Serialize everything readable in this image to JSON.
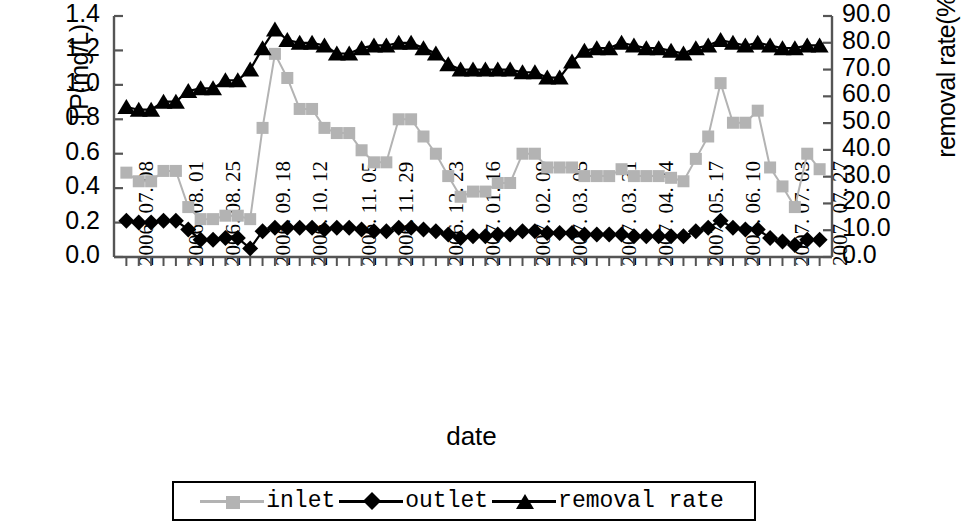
{
  "axes": {
    "y_left_title": "TP(mg/L)",
    "y_right_title": "removal rate(%)",
    "x_title": "date",
    "y_left_ticks": [
      "1.4",
      "1.2",
      "1.0",
      "0.8",
      "0.6",
      "0.4",
      "0.2",
      "0.0"
    ],
    "y_right_ticks": [
      "90.0",
      "80.0",
      "70.0",
      "60.0",
      "50.0",
      "40.0",
      "30.0",
      "20.0",
      "10.0",
      "0.0"
    ],
    "x_ticks": [
      "2006. 07. 08",
      "2006. 08. 01",
      "2006. 08. 25",
      "2006. 09. 18",
      "2006. 10. 12",
      "2006. 11. 05",
      "2006. 11. 29",
      "2006. 12. 23",
      "2007. 01. 16",
      "2007. 02. 09",
      "2007. 03. 05",
      "2007. 03. 31",
      "2007. 04. 24",
      "2007. 05. 17",
      "2007. 06. 10",
      "2007. 07. 03",
      "2007. 07. 27"
    ]
  },
  "legend": {
    "items": [
      {
        "label": "inlet",
        "marker": "square",
        "color": "#b0b0b0"
      },
      {
        "label": "outlet",
        "marker": "diamond",
        "color": "#000000"
      },
      {
        "label": "removal rate",
        "marker": "triangle",
        "color": "#000000"
      }
    ]
  },
  "colors": {
    "inlet": "#b3b3b3",
    "outlet": "#000000",
    "removal_rate": "#000000",
    "axis": "#555555"
  },
  "chart_data": {
    "type": "line",
    "title": "",
    "xlabel": "date",
    "ylabel": "TP(mg/L)",
    "y2label": "removal rate(%)",
    "ylim": [
      0,
      1.4
    ],
    "y2lim": [
      0,
      90
    ],
    "grid": false,
    "legend_position": "bottom",
    "x_tick_labels": [
      "2006. 07. 08",
      "2006. 08. 01",
      "2006. 08. 25",
      "2006. 09. 18",
      "2006. 10. 12",
      "2006. 11. 05",
      "2006. 11. 29",
      "2006. 12. 23",
      "2007. 01. 16",
      "2007. 02. 09",
      "2007. 03. 05",
      "2007. 03. 31",
      "2007. 04. 24",
      "2007. 05. 17",
      "2007. 06. 10",
      "2007. 07. 03",
      "2007. 07. 27"
    ],
    "x_tick_indices": [
      0,
      4,
      7,
      11,
      14,
      18,
      21,
      25,
      28,
      32,
      35,
      39,
      42,
      46,
      49,
      53,
      56
    ],
    "n_points": 57,
    "series": [
      {
        "name": "inlet",
        "axis": "left",
        "unit": "mg/L",
        "values": [
          0.49,
          0.44,
          0.44,
          0.5,
          0.5,
          0.29,
          0.22,
          0.22,
          0.24,
          0.24,
          0.22,
          0.75,
          1.18,
          1.04,
          0.86,
          0.86,
          0.75,
          0.72,
          0.72,
          0.62,
          0.55,
          0.55,
          0.8,
          0.8,
          0.7,
          0.6,
          0.47,
          0.35,
          0.38,
          0.38,
          0.43,
          0.43,
          0.6,
          0.6,
          0.52,
          0.52,
          0.52,
          0.47,
          0.47,
          0.47,
          0.51,
          0.47,
          0.47,
          0.47,
          0.46,
          0.44,
          0.57,
          0.7,
          1.01,
          0.78,
          0.78,
          0.85,
          0.52,
          0.41,
          0.29,
          0.6,
          0.51
        ]
      },
      {
        "name": "outlet",
        "axis": "left",
        "unit": "mg/L",
        "values": [
          0.21,
          0.2,
          0.2,
          0.21,
          0.21,
          0.16,
          0.1,
          0.1,
          0.11,
          0.11,
          0.05,
          0.15,
          0.17,
          0.17,
          0.17,
          0.17,
          0.16,
          0.17,
          0.17,
          0.16,
          0.15,
          0.15,
          0.17,
          0.17,
          0.16,
          0.15,
          0.13,
          0.11,
          0.12,
          0.12,
          0.13,
          0.13,
          0.15,
          0.15,
          0.14,
          0.14,
          0.14,
          0.13,
          0.13,
          0.13,
          0.13,
          0.12,
          0.12,
          0.12,
          0.12,
          0.12,
          0.15,
          0.17,
          0.21,
          0.17,
          0.16,
          0.16,
          0.11,
          0.09,
          0.07,
          0.1,
          0.1
        ]
      },
      {
        "name": "removal rate",
        "axis": "right",
        "unit": "%",
        "values": [
          56.0,
          55.0,
          55.0,
          58.0,
          58.0,
          62.0,
          63.0,
          63.0,
          66.0,
          66.0,
          70.0,
          78.0,
          85.0,
          81.0,
          80.0,
          80.0,
          79.0,
          76.0,
          76.0,
          78.0,
          79.0,
          79.0,
          80.0,
          80.0,
          78.0,
          76.0,
          72.0,
          70.0,
          70.0,
          70.0,
          70.0,
          70.0,
          69.0,
          69.0,
          67.0,
          67.0,
          73.0,
          77.0,
          78.0,
          78.0,
          80.0,
          79.0,
          78.0,
          78.0,
          77.0,
          76.0,
          78.0,
          79.0,
          81.0,
          80.0,
          79.0,
          80.0,
          79.0,
          78.0,
          78.0,
          79.0,
          79.0
        ]
      }
    ]
  }
}
